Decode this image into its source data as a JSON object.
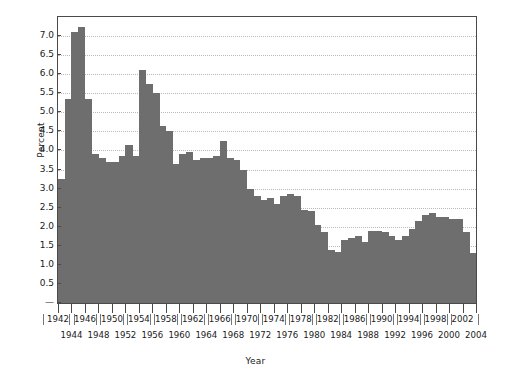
{
  "chart_data": {
    "type": "bar",
    "title": "",
    "subtitle": "",
    "xlabel": "Year",
    "ylabel": "Percent",
    "ylim": [
      0,
      7.5
    ],
    "xlim": [
      1941.5,
      2004.5
    ],
    "grid": true,
    "legend": null,
    "bar_color": "#6e6e6e",
    "axis_color": "#4a4a4a",
    "grid_color": "#b9b9b9",
    "y_ticks": [
      "—",
      "0.5",
      "1.0",
      "1.5",
      "2.0",
      "2.5",
      "3.0",
      "3.5",
      "4.0",
      "4.5",
      "5.0",
      "5.5",
      "6.0",
      "6.5",
      "7.0"
    ],
    "y_tick_values": [
      0,
      0.5,
      1.0,
      1.5,
      2.0,
      2.5,
      3.0,
      3.5,
      4.0,
      4.5,
      5.0,
      5.5,
      6.0,
      6.5,
      7.0
    ],
    "x_ticks_upper": [
      "1942",
      "1946",
      "1950",
      "1954",
      "1958",
      "1962",
      "1966",
      "1970",
      "1974",
      "1978",
      "1982",
      "1986",
      "1990",
      "1994",
      "1998",
      "2002"
    ],
    "x_ticks_lower": [
      "1944",
      "1948",
      "1952",
      "1956",
      "1960",
      "1964",
      "1968",
      "1972",
      "1976",
      "1980",
      "1984",
      "1988",
      "1992",
      "1996",
      "2000",
      "2004"
    ],
    "categories": [
      1942,
      1943,
      1944,
      1945,
      1946,
      1947,
      1948,
      1949,
      1950,
      1951,
      1952,
      1953,
      1954,
      1955,
      1956,
      1957,
      1958,
      1959,
      1960,
      1961,
      1962,
      1963,
      1964,
      1965,
      1966,
      1967,
      1968,
      1969,
      1970,
      1971,
      1972,
      1973,
      1974,
      1975,
      1976,
      1977,
      1978,
      1979,
      1980,
      1981,
      1982,
      1983,
      1984,
      1985,
      1986,
      1987,
      1988,
      1989,
      1990,
      1991,
      1992,
      1993,
      1994,
      1995,
      1996,
      1997,
      1998,
      1999,
      2000,
      2001,
      2002,
      2003
    ],
    "values": [
      3.25,
      5.35,
      7.1,
      7.25,
      5.35,
      3.9,
      3.8,
      3.7,
      3.7,
      3.85,
      4.15,
      3.85,
      6.1,
      5.75,
      5.5,
      4.65,
      4.5,
      3.65,
      3.9,
      3.95,
      3.75,
      3.8,
      3.8,
      3.85,
      4.25,
      3.8,
      3.75,
      3.5,
      3.0,
      2.8,
      2.7,
      2.75,
      2.6,
      2.8,
      2.85,
      2.8,
      2.45,
      2.4,
      2.05,
      1.85,
      1.4,
      1.35,
      1.65,
      1.7,
      1.75,
      1.6,
      1.9,
      1.9,
      1.85,
      1.75,
      1.65,
      1.75,
      1.95,
      2.15,
      2.3,
      2.35,
      2.25,
      2.25,
      2.2,
      2.2,
      1.85,
      1.3
    ]
  }
}
